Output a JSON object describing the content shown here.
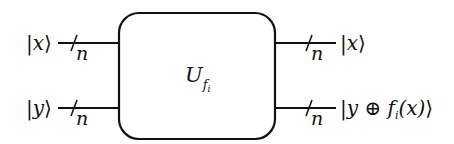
{
  "diagram": {
    "type": "quantum-circuit-oracle",
    "gate": {
      "label": "U",
      "subscript": "f",
      "sub_subscript": "i"
    },
    "inputs": [
      {
        "ket": "x",
        "bus_width": "n"
      },
      {
        "ket": "y",
        "bus_width": "n"
      }
    ],
    "outputs": [
      {
        "ket": "x",
        "bus_width": "n"
      },
      {
        "ket_prefix": "y ",
        "oplus": "⊕",
        "ket_func": " f",
        "func_sub": "i",
        "ket_arg": "(x)",
        "bus_width": "n"
      }
    ],
    "symbols": {
      "bar": "|",
      "rangle": "⟩"
    },
    "colors": {
      "line": "#111111",
      "background": "#ffffff"
    }
  }
}
